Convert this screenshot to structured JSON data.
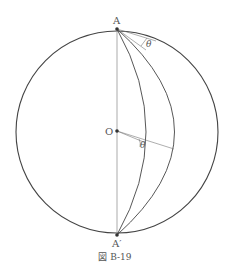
{
  "figure": {
    "caption": "図 B-19",
    "labels": {
      "top_point": "A",
      "bottom_point": "A′",
      "center": "O",
      "angle_top": "θ",
      "angle_center": "θ"
    },
    "colors": {
      "stroke": "#444444",
      "thin_stroke": "#777777",
      "text": "#555555"
    }
  }
}
